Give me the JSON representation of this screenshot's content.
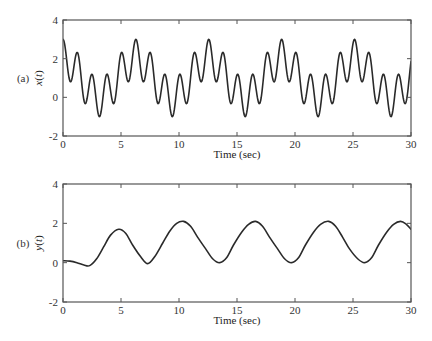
{
  "chart_data": [
    {
      "type": "line",
      "panel_label": "(a)",
      "title": "",
      "xlabel": "Time (sec)",
      "ylabel": "x(t)",
      "xlim": [
        0,
        30
      ],
      "ylim": [
        -2,
        4
      ],
      "xticks": [
        0,
        5,
        10,
        15,
        20,
        25,
        30
      ],
      "yticks": [
        -2,
        0,
        2,
        4
      ],
      "grid": false,
      "legend": null,
      "series": [
        {
          "name": "x(t)",
          "description": "1 + cos(t) + cos(5t)",
          "x": [
            0,
            0.63,
            1.26,
            1.88,
            2.51,
            3.14,
            3.77,
            4.4,
            5.03,
            5.65,
            6.28,
            6.91,
            7.54,
            8.17,
            8.8,
            9.42,
            10.05,
            10.68,
            11.31,
            11.94,
            12.57,
            13.19,
            13.82,
            14.45,
            15.08,
            15.71,
            16.34,
            16.96,
            17.59,
            18.22,
            18.85,
            19.48,
            20.11,
            20.73,
            21.36,
            21.99,
            22.62,
            23.25,
            23.88,
            24.5,
            25.13,
            25.76,
            26.39,
            27.02,
            27.65,
            28.27,
            28.9,
            29.53,
            30.0
          ],
          "y": [
            3.0,
            0.81,
            2.31,
            -0.31,
            1.19,
            -1.0,
            1.19,
            -0.31,
            2.31,
            0.81,
            3.0,
            0.81,
            2.31,
            -0.31,
            1.19,
            -1.0,
            1.19,
            -0.31,
            2.31,
            0.81,
            3.0,
            0.81,
            2.31,
            -0.31,
            1.19,
            -1.0,
            1.19,
            -0.31,
            2.31,
            0.81,
            3.0,
            0.81,
            2.31,
            -0.31,
            1.19,
            -1.0,
            1.19,
            -0.31,
            2.31,
            0.81,
            3.0,
            0.81,
            2.31,
            -0.31,
            1.19,
            -1.0,
            1.19,
            -0.31,
            1.6
          ]
        }
      ]
    },
    {
      "type": "line",
      "panel_label": "(b)",
      "title": "",
      "xlabel": "Time (sec)",
      "ylabel": "y(t)",
      "xlim": [
        0,
        30
      ],
      "ylim": [
        -2,
        4
      ],
      "xticks": [
        0,
        5,
        10,
        15,
        20,
        25,
        30
      ],
      "yticks": [
        -2,
        0,
        2,
        4
      ],
      "grid": false,
      "legend": null,
      "series": [
        {
          "name": "y(t)",
          "x": [
            0,
            0.6,
            1.2,
            1.8,
            2.3,
            2.9,
            3.5,
            4.1,
            4.8,
            5.4,
            6.0,
            6.7,
            7.3,
            7.9,
            8.6,
            9.2,
            9.8,
            10.4,
            11.0,
            11.6,
            12.3,
            12.9,
            13.5,
            14.1,
            14.7,
            15.4,
            16.0,
            16.6,
            17.2,
            17.8,
            18.5,
            19.1,
            19.7,
            20.3,
            20.9,
            21.6,
            22.2,
            22.9,
            23.5,
            24.1,
            24.7,
            25.4,
            26.0,
            26.6,
            27.2,
            27.9,
            28.5,
            29.1,
            29.6,
            30.0
          ],
          "y": [
            0.1,
            0.08,
            0.0,
            -0.12,
            -0.15,
            0.2,
            0.8,
            1.4,
            1.7,
            1.5,
            0.9,
            0.3,
            -0.05,
            0.3,
            1.0,
            1.6,
            2.0,
            2.1,
            1.85,
            1.3,
            0.7,
            0.2,
            0.0,
            0.25,
            0.9,
            1.55,
            1.95,
            2.1,
            1.85,
            1.3,
            0.7,
            0.2,
            0.0,
            0.25,
            0.9,
            1.55,
            1.95,
            2.1,
            1.85,
            1.3,
            0.7,
            0.2,
            0.0,
            0.25,
            0.9,
            1.55,
            1.95,
            2.1,
            1.95,
            1.7
          ]
        }
      ]
    }
  ]
}
